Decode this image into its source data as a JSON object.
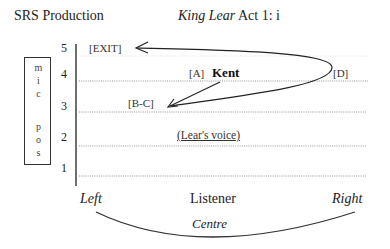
{
  "header": {
    "production": "SRS Production",
    "play_title": "King Lear",
    "scene": "Act 1: i"
  },
  "mic_box": {
    "letters": [
      "m",
      "i",
      "c",
      "",
      "p",
      "o",
      "s"
    ]
  },
  "levels": [
    "5",
    "4",
    "3",
    "2",
    "1"
  ],
  "positions": {
    "exit": "[EXIT]",
    "a": "[A]",
    "character": "Kent",
    "d": "[D]",
    "bc": "[B-C]",
    "lears_voice": "(Lear's voice)"
  },
  "bottom_axis": {
    "left": "Left",
    "listener": "Listener",
    "right": "Right",
    "centre": "Centre"
  },
  "colors": {
    "line": "#333333",
    "dotted": "#8a8a8a",
    "text": "#222222"
  }
}
